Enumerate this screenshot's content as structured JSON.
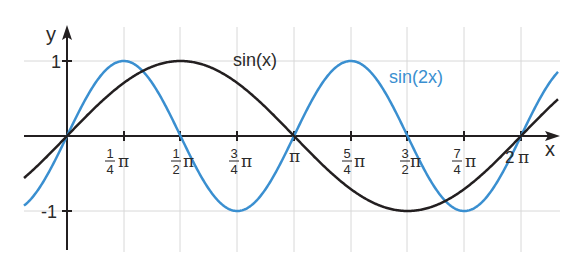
{
  "chart_data": {
    "type": "line",
    "title": "",
    "xlabel": "x",
    "ylabel": "y",
    "xlim": [
      -0.77,
      2.3
    ],
    "xlim_units": "multiples of pi (approx. -0.24pi to 2.27pi)",
    "ylim": [
      -1.5,
      1.5
    ],
    "grid": true,
    "x_ticks": [
      {
        "value_pi": 0.25,
        "label_num": "1",
        "label_den": "4",
        "label_suffix": "π"
      },
      {
        "value_pi": 0.5,
        "label_num": "1",
        "label_den": "2",
        "label_suffix": "π"
      },
      {
        "value_pi": 0.75,
        "label_num": "3",
        "label_den": "4",
        "label_suffix": "π"
      },
      {
        "value_pi": 1.0,
        "label": "π"
      },
      {
        "value_pi": 1.25,
        "label_num": "5",
        "label_den": "4",
        "label_suffix": "π"
      },
      {
        "value_pi": 1.5,
        "label_num": "3",
        "label_den": "2",
        "label_suffix": "π"
      },
      {
        "value_pi": 1.75,
        "label_num": "7",
        "label_den": "4",
        "label_suffix": "π"
      },
      {
        "value_pi": 2.0,
        "label": "2 π"
      }
    ],
    "y_ticks": [
      {
        "value": 1,
        "label": "1"
      },
      {
        "value": -1,
        "label": "-1"
      }
    ],
    "series": [
      {
        "name": "sin(x)",
        "color": "#231f20",
        "function": "sin(x)",
        "x_pi": [
          0,
          0.25,
          0.5,
          0.75,
          1.0,
          1.25,
          1.5,
          1.75,
          2.0
        ],
        "values": [
          0,
          0.71,
          1,
          0.71,
          0,
          -0.71,
          -1,
          -0.71,
          0
        ]
      },
      {
        "name": "sin(2x)",
        "color": "#3a8fd0",
        "function": "sin(2x)",
        "x_pi": [
          0,
          0.25,
          0.5,
          0.75,
          1.0,
          1.25,
          1.5,
          1.75,
          2.0
        ],
        "values": [
          0,
          1,
          0,
          -1,
          0,
          1,
          0,
          -1,
          0
        ]
      }
    ],
    "annotations": [
      {
        "text": "sin(x)",
        "near_x_pi": 0.95,
        "near_y": 1.0,
        "color": "#231f20"
      },
      {
        "text": "sin(2x)",
        "near_x_pi": 1.45,
        "near_y": 0.8,
        "color": "#3a8fd0"
      }
    ],
    "legend": "none (inline labels)"
  },
  "labels": {
    "x_axis": "x",
    "y_axis": "y",
    "y_one": "1",
    "y_minus_one": "-1",
    "series_sin": "sin(x)",
    "series_sin2": "sin(2x)",
    "pi": "π",
    "two_pi_num": "2",
    "t1_num": "1",
    "t1_den": "4",
    "t2_num": "1",
    "t2_den": "2",
    "t3_num": "3",
    "t3_den": "4",
    "t5_num": "5",
    "t5_den": "4",
    "t6_num": "3",
    "t6_den": "2",
    "t7_num": "7",
    "t7_den": "4"
  }
}
